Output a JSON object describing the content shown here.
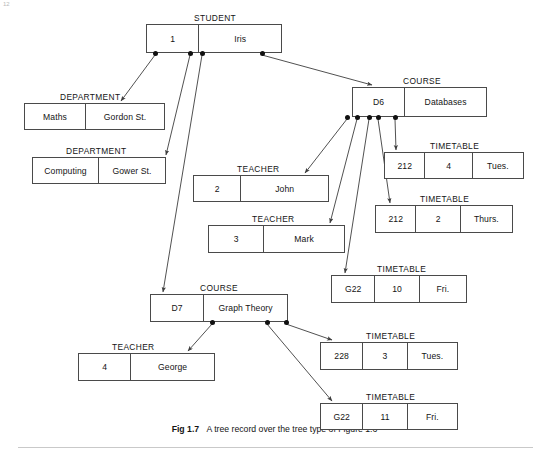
{
  "figure": {
    "page_number": "12",
    "caption_prefix": "Fig 1.7",
    "caption_text": "A tree record over the tree type of Figure 1.6",
    "line_color": "#4a4a4a",
    "dot_color": "#111111",
    "background": "#ffffff"
  },
  "nodes": [
    {
      "id": "student-1",
      "type_label": "STUDENT",
      "label_x": 194,
      "label_y": 13,
      "x": 146,
      "y": 24,
      "w": 136,
      "h": 29,
      "cells": [
        {
          "text": "1",
          "w": 52
        },
        {
          "text": "Iris",
          "w": 84
        }
      ],
      "dots": [
        {
          "x": 155
        },
        {
          "x": 190
        },
        {
          "x": 202
        },
        {
          "x": 262
        }
      ]
    },
    {
      "id": "department-maths",
      "type_label": "DEPARTMENT",
      "label_x": 60,
      "label_y": 92,
      "x": 24,
      "y": 103,
      "w": 141,
      "h": 27,
      "cells": [
        {
          "text": "Maths",
          "w": 61
        },
        {
          "text": "Gordon St.",
          "w": 80
        }
      ],
      "dots": []
    },
    {
      "id": "department-computing",
      "type_label": "DEPARTMENT",
      "label_x": 66,
      "label_y": 146,
      "x": 32,
      "y": 157,
      "w": 134,
      "h": 27,
      "cells": [
        {
          "text": "Computing",
          "w": 66
        },
        {
          "text": "Gower St.",
          "w": 68
        }
      ],
      "dots": []
    },
    {
      "id": "course-d6",
      "type_label": "COURSE",
      "label_x": 403,
      "label_y": 76,
      "x": 352,
      "y": 87,
      "w": 135,
      "h": 30,
      "cells": [
        {
          "text": "D6",
          "w": 52
        },
        {
          "text": "Databases",
          "w": 83
        }
      ],
      "dots": [
        {
          "x": 347
        },
        {
          "x": 357
        },
        {
          "x": 369
        },
        {
          "x": 378
        },
        {
          "x": 395
        }
      ]
    },
    {
      "id": "teacher-john",
      "type_label": "TEACHER",
      "label_x": 237,
      "label_y": 164,
      "x": 193,
      "y": 175,
      "w": 136,
      "h": 27,
      "cells": [
        {
          "text": "2",
          "w": 47
        },
        {
          "text": "John",
          "w": 89
        }
      ],
      "dots": []
    },
    {
      "id": "teacher-mark",
      "type_label": "TEACHER",
      "label_x": 252,
      "label_y": 214,
      "x": 208,
      "y": 225,
      "w": 137,
      "h": 28,
      "cells": [
        {
          "text": "3",
          "w": 55
        },
        {
          "text": "Mark",
          "w": 82
        }
      ],
      "dots": []
    },
    {
      "id": "timetable-212-4-tues",
      "type_label": "TIMETABLE",
      "label_x": 430,
      "label_y": 141,
      "x": 384,
      "y": 152,
      "w": 140,
      "h": 27,
      "cells": [
        {
          "text": "212",
          "w": 40
        },
        {
          "text": "4",
          "w": 48
        },
        {
          "text": "Tues.",
          "w": 52
        }
      ],
      "dots": []
    },
    {
      "id": "timetable-212-2-thurs",
      "type_label": "TIMETABLE",
      "label_x": 420,
      "label_y": 194,
      "x": 375,
      "y": 205,
      "w": 138,
      "h": 28,
      "cells": [
        {
          "text": "212",
          "w": 40
        },
        {
          "text": "2",
          "w": 45
        },
        {
          "text": "Thurs.",
          "w": 53
        }
      ],
      "dots": []
    },
    {
      "id": "timetable-g22-10-fri",
      "type_label": "TIMETABLE",
      "label_x": 377,
      "label_y": 264,
      "x": 331,
      "y": 275,
      "w": 136,
      "h": 28,
      "cells": [
        {
          "text": "G22",
          "w": 43
        },
        {
          "text": "10",
          "w": 45
        },
        {
          "text": "Fri.",
          "w": 48
        }
      ],
      "dots": []
    },
    {
      "id": "course-d7",
      "type_label": "COURSE",
      "label_x": 200,
      "label_y": 283,
      "x": 150,
      "y": 294,
      "w": 138,
      "h": 28,
      "cells": [
        {
          "text": "D7",
          "w": 53
        },
        {
          "text": "Graph Theory",
          "w": 85
        }
      ],
      "dots": [
        {
          "x": 212
        },
        {
          "x": 267
        },
        {
          "x": 286
        }
      ]
    },
    {
      "id": "teacher-george",
      "type_label": "TEACHER",
      "label_x": 112,
      "label_y": 342,
      "x": 78,
      "y": 353,
      "w": 137,
      "h": 28,
      "cells": [
        {
          "text": "4",
          "w": 52
        },
        {
          "text": "George",
          "w": 85
        }
      ],
      "dots": []
    },
    {
      "id": "timetable-228-3-tues",
      "type_label": "TIMETABLE",
      "label_x": 366,
      "label_y": 331,
      "x": 320,
      "y": 342,
      "w": 138,
      "h": 28,
      "cells": [
        {
          "text": "228",
          "w": 42
        },
        {
          "text": "3",
          "w": 45
        },
        {
          "text": "Tues.",
          "w": 51
        }
      ],
      "dots": []
    },
    {
      "id": "timetable-g22-11-fri",
      "type_label": "TIMETABLE",
      "label_x": 366,
      "label_y": 392,
      "x": 320,
      "y": 403,
      "w": 138,
      "h": 27,
      "cells": [
        {
          "text": "G22",
          "w": 42
        },
        {
          "text": "11",
          "w": 45
        },
        {
          "text": "Fri.",
          "w": 51
        }
      ],
      "dots": []
    }
  ],
  "edges": [
    {
      "name": "student-to-department-maths",
      "x1": 155,
      "y1": 55,
      "x2": 121,
      "y2": 101
    },
    {
      "name": "student-to-department-computing",
      "x1": 190,
      "y1": 55,
      "x2": 166,
      "y2": 155
    },
    {
      "name": "student-to-course-d7",
      "x1": 202,
      "y1": 55,
      "x2": 163,
      "y2": 292
    },
    {
      "name": "student-to-course-d6",
      "x1": 262,
      "y1": 55,
      "x2": 372,
      "y2": 85
    },
    {
      "name": "course-d6-to-teacher-john",
      "x1": 347,
      "y1": 119,
      "x2": 305,
      "y2": 173
    },
    {
      "name": "course-d6-to-teacher-mark",
      "x1": 357,
      "y1": 119,
      "x2": 330,
      "y2": 223
    },
    {
      "name": "course-d6-to-timetable-g22-10",
      "x1": 369,
      "y1": 119,
      "x2": 345,
      "y2": 273
    },
    {
      "name": "course-d6-to-timetable-212-2",
      "x1": 378,
      "y1": 119,
      "x2": 390,
      "y2": 203
    },
    {
      "name": "course-d6-to-timetable-212-4",
      "x1": 395,
      "y1": 119,
      "x2": 396,
      "y2": 150
    },
    {
      "name": "course-d7-to-teacher-george",
      "x1": 212,
      "y1": 324,
      "x2": 188,
      "y2": 351
    },
    {
      "name": "course-d7-to-timetable-g22-11",
      "x1": 267,
      "y1": 324,
      "x2": 332,
      "y2": 401
    },
    {
      "name": "course-d7-to-timetable-228-3",
      "x1": 286,
      "y1": 324,
      "x2": 332,
      "y2": 340
    }
  ]
}
